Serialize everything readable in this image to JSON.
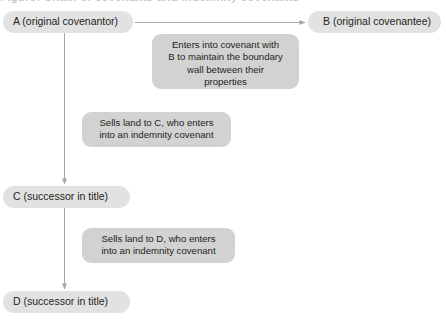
{
  "diagram": {
    "title_partial": "Figure: Chain of covenants and indemnity covenants",
    "type": "flow-diagram",
    "colors": {
      "node_fill": "#e2e2e2",
      "callout_fill": "#d2d2d2",
      "text": "#231f20",
      "connector": "#a6a6a6",
      "background": "#ffffff"
    },
    "nodes": [
      {
        "id": "A",
        "label": "A (original covenantor)"
      },
      {
        "id": "B",
        "label": "B (original covenantee)"
      },
      {
        "id": "C",
        "label": "C (successor in title)"
      },
      {
        "id": "D",
        "label": "D (successor in title)"
      }
    ],
    "callouts": [
      {
        "id": "covenant-ab",
        "text": "Enters into covenant with\nB to maintain the boundary\nwall between their\nproperties"
      },
      {
        "id": "sale-a-to-c",
        "text": "Sells land to C, who enters\ninto an indemnity covenant"
      },
      {
        "id": "sale-c-to-d",
        "text": "Sells land to D, who enters\ninto an indemnity covenant"
      }
    ],
    "connectors": [
      {
        "id": "a-to-b",
        "from": "A",
        "to": "B",
        "direction": "horizontal"
      },
      {
        "id": "a-to-c",
        "from": "A",
        "to": "C",
        "direction": "vertical"
      },
      {
        "id": "c-to-d",
        "from": "C",
        "to": "D",
        "direction": "vertical"
      }
    ]
  }
}
